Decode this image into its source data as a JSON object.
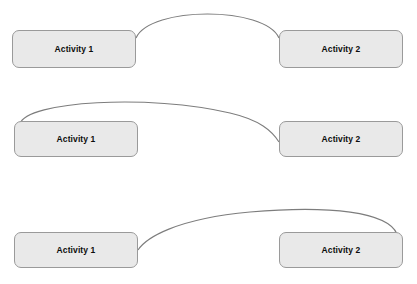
{
  "diagram": {
    "canvas": {
      "width": 417,
      "height": 284,
      "background": "#ffffff"
    },
    "style": {
      "box_fill": "#e9e9e9",
      "box_border": "#9a9a9a",
      "arc_stroke": "#7d7d7d",
      "label_color": "#0d0d0d"
    },
    "rows": [
      {
        "id": "row-1",
        "connection": "top-to-top",
        "source": {
          "label": "Activity 1",
          "x": 12,
          "y": 30,
          "w": 124,
          "h": 38
        },
        "target": {
          "label": "Activity 2",
          "x": 279,
          "y": 30,
          "w": 124,
          "h": 38
        },
        "arc": {
          "from_x": 136,
          "from_y": 38,
          "to_x": 279,
          "to_y": 38,
          "peak_y": 13
        }
      },
      {
        "id": "row-2",
        "connection": "top-left-corner-to-left-edge",
        "source": {
          "label": "Activity 1",
          "x": 14,
          "y": 121,
          "w": 124,
          "h": 36
        },
        "target": {
          "label": "Activity 2",
          "x": 279,
          "y": 121,
          "w": 124,
          "h": 36
        },
        "arc": {
          "from_x": 20,
          "from_y": 124,
          "to_x": 279,
          "to_y": 142,
          "peak_y": 99
        }
      },
      {
        "id": "row-3",
        "connection": "right-edge-to-top-right-corner",
        "source": {
          "label": "Activity 1",
          "x": 14,
          "y": 232,
          "w": 124,
          "h": 36
        },
        "target": {
          "label": "Activity 2",
          "x": 279,
          "y": 232,
          "w": 124,
          "h": 36
        },
        "arc": {
          "from_x": 138,
          "from_y": 250,
          "to_x": 397,
          "to_y": 234,
          "peak_y": 210
        }
      }
    ]
  }
}
